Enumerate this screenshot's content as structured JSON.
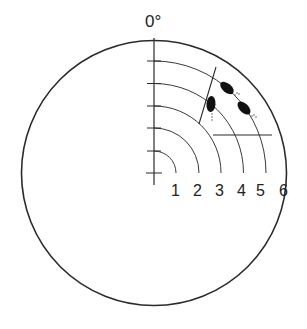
{
  "diagram": {
    "type": "polar-field-chart",
    "top_label": "0°",
    "ring_labels": [
      "1",
      "2",
      "3",
      "4",
      "5",
      "6"
    ],
    "colors": {
      "stroke": "#2b2b2b",
      "fill": "#111111",
      "background": "#ffffff"
    },
    "geometry": {
      "center": [
        154,
        173
      ],
      "ring_spacing": 22.3,
      "outer_radius": 133
    },
    "markers": [
      {
        "name": "spot-a",
        "cx": 227,
        "cy": 88,
        "rx": 8,
        "ry": 4.5,
        "rotate": 40
      },
      {
        "name": "spot-b",
        "cx": 244,
        "cy": 108,
        "rx": 8,
        "ry": 4.5,
        "rotate": 45
      },
      {
        "name": "spot-c",
        "cx": 211,
        "cy": 104,
        "rx": 4.5,
        "ry": 8,
        "rotate": 5
      }
    ],
    "lines": [
      {
        "name": "slanted-line",
        "x1": 216,
        "y1": 67,
        "x2": 199,
        "y2": 124
      },
      {
        "name": "horizontal-line",
        "x1": 213,
        "y1": 135,
        "x2": 272,
        "y2": 135
      }
    ]
  }
}
